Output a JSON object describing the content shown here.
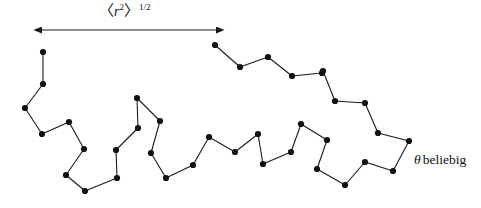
{
  "figure": {
    "name": "polymer-random-coil",
    "background_color": "#ffffff",
    "stroke_color": "#1a1a1a",
    "node_color": "#111111",
    "width": 481,
    "height": 208
  },
  "labels": {
    "rms_distance": {
      "full_text": "⟨r²⟩¹ᐟ²",
      "open_bracket": "〈",
      "variable": "r",
      "variable_exponent": "2",
      "close_bracket": "〉",
      "superscript": "1/2",
      "x": 99,
      "y": 3
    },
    "theta_note": {
      "full_text": "θ beliebig",
      "symbol": "θ",
      "word": "beliebig",
      "x": 414,
      "y": 153
    }
  },
  "arrow": {
    "name": "end-to-end-distance-arrow",
    "style": "double-headed",
    "x1": 42,
    "y1": 30,
    "x2": 216,
    "y2": 30,
    "color": "#1a1a1a"
  },
  "chart_data": {
    "type": "scatter",
    "title": "",
    "xlabel": "",
    "ylabel": "",
    "grid": false,
    "legend": false,
    "xlim": [
      0,
      481
    ],
    "ylim": [
      0,
      208
    ],
    "series": [
      {
        "name": "freely-jointed-chain",
        "node_count": 41,
        "node_radius": 3.1,
        "line_width": 1.1,
        "points": [
          [
            43,
            52
          ],
          [
            43,
            84
          ],
          [
            25,
            108
          ],
          [
            42,
            134
          ],
          [
            69,
            122
          ],
          [
            84,
            149
          ],
          [
            66,
            175
          ],
          [
            85,
            191
          ],
          [
            117,
            178
          ],
          [
            116,
            150
          ],
          [
            138,
            128
          ],
          [
            137,
            98
          ],
          [
            160,
            121
          ],
          [
            151,
            153
          ],
          [
            166,
            178
          ],
          [
            193,
            165
          ],
          [
            209,
            137
          ],
          [
            235,
            152
          ],
          [
            258,
            134
          ],
          [
            263,
            164
          ],
          [
            291,
            152
          ],
          [
            301,
            124
          ],
          [
            327,
            140
          ],
          [
            317,
            169
          ],
          [
            345,
            185
          ],
          [
            365,
            162
          ],
          [
            393,
            171
          ],
          [
            409,
            141
          ],
          [
            378,
            133
          ],
          [
            365,
            103
          ],
          [
            335,
            101
          ],
          [
            323,
            71
          ],
          [
            322,
            73
          ],
          [
            292,
            76
          ],
          [
            268,
            57
          ],
          [
            240,
            67
          ],
          [
            215,
            45
          ]
        ]
      }
    ]
  },
  "chain_segments": [
    {
      "name": "left-arm",
      "points": [
        [
          43,
          52
        ],
        [
          43,
          84
        ],
        [
          25,
          108
        ],
        [
          42,
          134
        ],
        [
          69,
          122
        ],
        [
          84,
          149
        ],
        [
          66,
          175
        ],
        [
          85,
          191
        ],
        [
          117,
          178
        ],
        [
          116,
          150
        ],
        [
          138,
          128
        ],
        [
          137,
          98
        ],
        [
          160,
          121
        ],
        [
          151,
          153
        ],
        [
          166,
          178
        ],
        [
          193,
          165
        ],
        [
          209,
          137
        ],
        [
          235,
          152
        ],
        [
          258,
          134
        ],
        [
          263,
          164
        ],
        [
          291,
          152
        ],
        [
          301,
          124
        ],
        [
          327,
          140
        ],
        [
          317,
          169
        ],
        [
          345,
          185
        ],
        [
          365,
          162
        ],
        [
          393,
          171
        ],
        [
          409,
          141
        ],
        [
          378,
          133
        ],
        [
          365,
          103
        ],
        [
          335,
          101
        ],
        [
          323,
          71
        ],
        [
          292,
          76
        ],
        [
          268,
          57
        ],
        [
          240,
          67
        ],
        [
          215,
          45
        ]
      ]
    }
  ]
}
